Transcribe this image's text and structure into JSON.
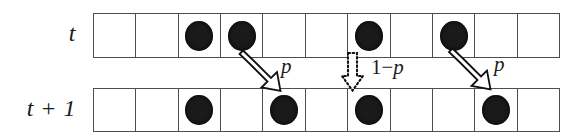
{
  "figure": {
    "cell_count": 11,
    "colors": {
      "grid_line": "#4e4e4e",
      "particle": "#1a1a1a",
      "arrow_outline": "#111111",
      "text": "#1b1b1b",
      "background": "#ffffff"
    }
  },
  "rows": [
    {
      "id": "row-top",
      "label": "t",
      "occupancy": [
        0,
        0,
        1,
        1,
        0,
        0,
        1,
        0,
        1,
        0,
        0
      ]
    },
    {
      "id": "row-bottom",
      "label": "t + 1",
      "occupancy": [
        0,
        0,
        1,
        0,
        1,
        0,
        1,
        0,
        0,
        1,
        0
      ]
    }
  ],
  "transitions": [
    {
      "name": "hop-left-pair",
      "style": "solid-outline-block-arrow",
      "from_cell": 3,
      "to_cell": 4,
      "label": "p"
    },
    {
      "name": "stay-blocked",
      "style": "dotted-outline-block-arrow",
      "from_cell": 6,
      "to_cell": 6,
      "label_prefix": "1",
      "label_minus": "−",
      "label_suffix": "p",
      "label": "1−p"
    },
    {
      "name": "hop-right-pair",
      "style": "solid-outline-block-arrow",
      "from_cell": 8,
      "to_cell": 9,
      "label": "p"
    }
  ]
}
